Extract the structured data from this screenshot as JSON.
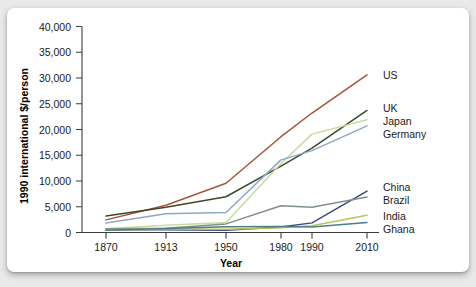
{
  "chart_data": {
    "type": "line",
    "title": "",
    "xlabel": "Year",
    "ylabel": "1990 international $/person",
    "x": [
      1870,
      1913,
      1950,
      1980,
      1990,
      2010
    ],
    "x_tick_labels": [
      "1870",
      "1913",
      "1950",
      "1980",
      "1990",
      "2010"
    ],
    "y_tick_labels": [
      "0",
      "5,000",
      "10,000",
      "15,000",
      "20,000",
      "25,000",
      "30,000",
      "35,000",
      "40,000"
    ],
    "y_ticks": [
      0,
      5000,
      10000,
      15000,
      20000,
      25000,
      30000,
      35000,
      40000
    ],
    "ylim": [
      0,
      40000
    ],
    "grid": false,
    "legend_position": "right-inline-labels",
    "series": [
      {
        "name": "US",
        "color": "#a8543a",
        "values": [
          2450,
          5300,
          9560,
          18600,
          23200,
          30600
        ]
      },
      {
        "name": "UK",
        "color": "#3c4a28",
        "values": [
          3190,
          4920,
          6940,
          12900,
          16400,
          23700
        ]
      },
      {
        "name": "Japan",
        "color": "#cdd9a3",
        "values": [
          740,
          1390,
          1920,
          13400,
          19100,
          21900
        ]
      },
      {
        "name": "Germany",
        "color": "#8fa9c4",
        "values": [
          1840,
          3650,
          3880,
          14100,
          15900,
          20700
        ]
      },
      {
        "name": "China",
        "color": "#3d4a7a",
        "values": [
          530,
          550,
          450,
          1060,
          1870,
          8030
        ]
      },
      {
        "name": "Brazil",
        "color": "#7f9187",
        "values": [
          710,
          810,
          1670,
          5200,
          4920,
          6880
        ]
      },
      {
        "name": "India",
        "color": "#b9c45a",
        "values": [
          530,
          670,
          620,
          940,
          1310,
          3370
        ]
      },
      {
        "name": "Ghana",
        "color": "#4c7f86",
        "values": [
          430,
          780,
          1120,
          1160,
          1060,
          1920
        ]
      }
    ]
  },
  "labels": {
    "US": "US",
    "UK": "UK",
    "Japan": "Japan",
    "Germany": "Germany",
    "China": "China",
    "Brazil": "Brazil",
    "India": "India",
    "Ghana": "Ghana"
  }
}
